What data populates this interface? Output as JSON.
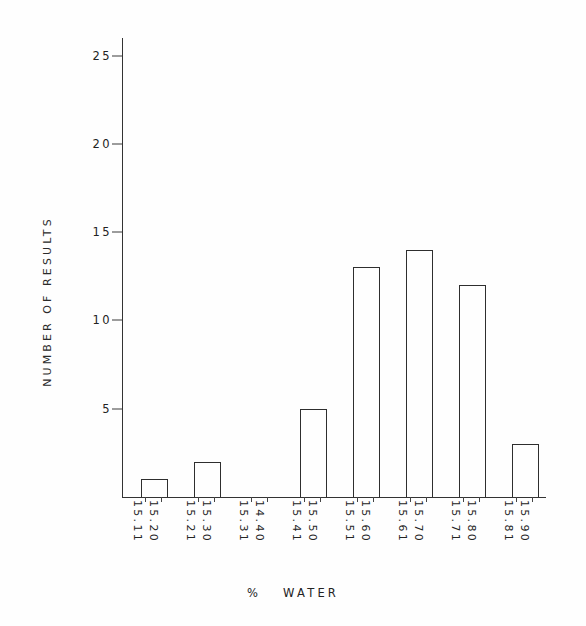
{
  "chart_data": {
    "type": "bar",
    "title": "",
    "subtitle": "",
    "xlabel": "%  WATER",
    "xlabel_parts": {
      "symbol": "%",
      "word": "WATER"
    },
    "ylabel": "NUMBER OF RESULTS",
    "ylim": [
      0,
      26
    ],
    "yticks": [
      5,
      10,
      15,
      20,
      25
    ],
    "ytick_labels": [
      "5",
      "10",
      "15",
      "20",
      "25"
    ],
    "grid": false,
    "legend": null,
    "legend_position": "none",
    "bin_labels_rotation": 90,
    "categories": [
      "15.11 - 15.20",
      "15.21 - 15.30",
      "15.31 - 14.40",
      "15.41 - 15.50",
      "15.51 - 15.60",
      "15.61 - 15.70",
      "15.71 - 15.80",
      "15.81 - 15.90"
    ],
    "bins": [
      {
        "upper": "15.11",
        "lower": "15.20",
        "value": 1
      },
      {
        "upper": "15.21",
        "lower": "15.30",
        "value": 2
      },
      {
        "upper": "15.31",
        "lower": "14.40",
        "value": 0
      },
      {
        "upper": "15.41",
        "lower": "15.50",
        "value": 5
      },
      {
        "upper": "15.51",
        "lower": "15.60",
        "value": 13
      },
      {
        "upper": "15.61",
        "lower": "15.70",
        "value": 14
      },
      {
        "upper": "15.71",
        "lower": "15.80",
        "value": 12
      },
      {
        "upper": "15.81",
        "lower": "15.90",
        "value": 3
      }
    ],
    "values": [
      1,
      2,
      0,
      5,
      13,
      14,
      12,
      3
    ],
    "bar_color": "#ffffff",
    "bar_edge_color": "#2e2e2e",
    "axis_color": "#333333",
    "background_color": "#ffffff"
  }
}
